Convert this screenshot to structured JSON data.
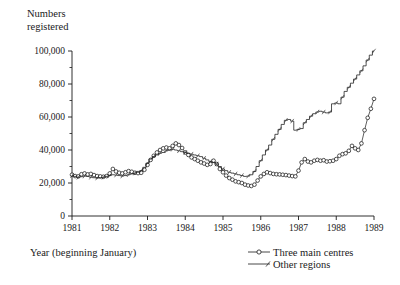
{
  "chart_data": {
    "type": "line",
    "title": "",
    "ylabel_line1": "Numbers",
    "ylabel_line2": "registered",
    "xlabel": "Year (beginning January)",
    "grid": false,
    "legend_position": "bottom-right",
    "ylim": [
      0,
      100000
    ],
    "xlim": [
      1981.0,
      1989.0
    ],
    "ytick_labels": [
      "0",
      "20,000",
      "40,000",
      "60,000",
      "80,000",
      "100,000"
    ],
    "ytick_values": [
      0,
      20000,
      40000,
      60000,
      80000,
      100000
    ],
    "yminor_values": [
      10000,
      30000,
      50000,
      70000,
      90000
    ],
    "xtick_labels": [
      "1981",
      "1982",
      "1983",
      "1984",
      "1985",
      "1986",
      "1987",
      "1988",
      "1989"
    ],
    "xtick_values": [
      1981,
      1982,
      1983,
      1984,
      1985,
      1986,
      1987,
      1988,
      1989
    ],
    "series": [
      {
        "name": "Three main centres",
        "marker": "open-circle",
        "x": [
          1981.0,
          1981.083,
          1981.167,
          1981.25,
          1981.333,
          1981.417,
          1981.5,
          1981.583,
          1981.667,
          1981.75,
          1981.833,
          1981.917,
          1982.0,
          1982.083,
          1982.167,
          1982.25,
          1982.333,
          1982.417,
          1982.5,
          1982.583,
          1982.667,
          1982.75,
          1982.833,
          1982.917,
          1983.0,
          1983.083,
          1983.167,
          1983.25,
          1983.333,
          1983.417,
          1983.5,
          1983.583,
          1983.667,
          1983.75,
          1983.833,
          1983.917,
          1984.0,
          1984.083,
          1984.167,
          1984.25,
          1984.333,
          1984.417,
          1984.5,
          1984.583,
          1984.667,
          1984.75,
          1984.833,
          1984.917,
          1985.0,
          1985.083,
          1985.167,
          1985.25,
          1985.333,
          1985.417,
          1985.5,
          1985.583,
          1985.667,
          1985.75,
          1985.833,
          1985.917,
          1986.0,
          1986.083,
          1986.167,
          1986.25,
          1986.333,
          1986.417,
          1986.5,
          1986.583,
          1986.667,
          1986.75,
          1986.833,
          1986.917,
          1987.0,
          1987.083,
          1987.167,
          1987.25,
          1987.333,
          1987.417,
          1987.5,
          1987.583,
          1987.667,
          1987.75,
          1987.833,
          1987.917,
          1988.0,
          1988.083,
          1988.167,
          1988.25,
          1988.333,
          1988.417,
          1988.5,
          1988.583,
          1988.667,
          1988.75,
          1988.833,
          1988.917,
          1989.0
        ],
        "values": [
          25000,
          24200,
          24000,
          25300,
          25800,
          25200,
          25500,
          24800,
          24200,
          24000,
          23800,
          24200,
          25800,
          28500,
          27000,
          26200,
          25800,
          26500,
          27200,
          26800,
          26200,
          26000,
          26200,
          28000,
          31000,
          34000,
          36500,
          38500,
          40000,
          41000,
          41500,
          41000,
          42500,
          44000,
          43000,
          41200,
          38500,
          37000,
          35500,
          34500,
          33500,
          32500,
          31800,
          31000,
          31500,
          33500,
          31500,
          28500,
          26500,
          24500,
          23000,
          22000,
          21000,
          20500,
          20000,
          19000,
          18500,
          18200,
          19000,
          21500,
          24000,
          25500,
          26500,
          26000,
          25500,
          25300,
          25200,
          25000,
          24800,
          24500,
          24200,
          24000,
          27500,
          32500,
          34500,
          33000,
          32500,
          33500,
          34000,
          33500,
          33800,
          33000,
          33200,
          33500,
          34500,
          36500,
          37500,
          38000,
          39500,
          42500,
          41000,
          40000,
          44000,
          52000,
          59500,
          65000,
          71000
        ]
      },
      {
        "name": "Other regions",
        "marker": "tick",
        "x": [
          1981.0,
          1981.083,
          1981.167,
          1981.25,
          1981.333,
          1981.417,
          1981.5,
          1981.583,
          1981.667,
          1981.75,
          1981.833,
          1981.917,
          1982.0,
          1982.083,
          1982.167,
          1982.25,
          1982.333,
          1982.417,
          1982.5,
          1982.583,
          1982.667,
          1982.75,
          1982.833,
          1982.917,
          1983.0,
          1983.083,
          1983.167,
          1983.25,
          1983.333,
          1983.417,
          1983.5,
          1983.583,
          1983.667,
          1983.75,
          1983.833,
          1983.917,
          1984.0,
          1984.083,
          1984.167,
          1984.25,
          1984.333,
          1984.417,
          1984.5,
          1984.583,
          1984.667,
          1984.75,
          1984.833,
          1984.917,
          1985.0,
          1985.083,
          1985.167,
          1985.25,
          1985.333,
          1985.417,
          1985.5,
          1985.583,
          1985.667,
          1985.75,
          1985.833,
          1985.917,
          1986.0,
          1986.083,
          1986.167,
          1986.25,
          1986.333,
          1986.417,
          1986.5,
          1986.583,
          1986.667,
          1986.75,
          1986.833,
          1986.917,
          1987.0,
          1987.083,
          1987.167,
          1987.25,
          1987.333,
          1987.417,
          1987.5,
          1987.583,
          1987.667,
          1987.75,
          1987.833,
          1987.917,
          1988.0,
          1988.083,
          1988.167,
          1988.25,
          1988.333,
          1988.417,
          1988.5,
          1988.583,
          1988.667,
          1988.75,
          1988.833,
          1988.917,
          1989.0
        ],
        "values": [
          24500,
          24000,
          23500,
          23800,
          24200,
          24000,
          23500,
          23200,
          23000,
          23200,
          23500,
          24000,
          24500,
          25000,
          24800,
          24500,
          24200,
          24500,
          25000,
          25500,
          26000,
          26500,
          27500,
          29500,
          32000,
          34500,
          36000,
          37000,
          38000,
          38500,
          39500,
          40000,
          40500,
          40000,
          39500,
          39000,
          38500,
          38000,
          37500,
          37000,
          36500,
          36000,
          35000,
          34000,
          33000,
          32500,
          31500,
          30000,
          28500,
          27500,
          26500,
          26000,
          25500,
          25000,
          24500,
          24000,
          24200,
          25000,
          27000,
          30000,
          33500,
          37000,
          40000,
          43000,
          46500,
          49500,
          52500,
          55500,
          58000,
          58500,
          57500,
          52000,
          52500,
          53000,
          56500,
          58500,
          60500,
          62000,
          63000,
          63500,
          63000,
          62500,
          63000,
          68000,
          68500,
          68000,
          72000,
          75500,
          78000,
          80500,
          83000,
          85500,
          88000,
          91000,
          94500,
          97500,
          100000
        ]
      }
    ]
  },
  "legend": {
    "entries": [
      {
        "label": "Three main centres",
        "marker": "open-circle"
      },
      {
        "label": "Other regions",
        "marker": "tick"
      }
    ]
  },
  "colors": {
    "line": "#1a1a1a",
    "axis": "#1a1a1a",
    "background": "#ffffff"
  }
}
